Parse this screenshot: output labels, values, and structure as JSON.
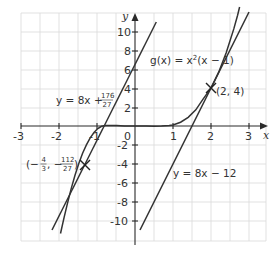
{
  "diagram": {
    "type": "function-graph",
    "axes": {
      "x_label": "x",
      "y_label": "y",
      "x_ticks": [
        "-3",
        "-2",
        "-1",
        "1",
        "2",
        "3"
      ],
      "y_ticks": [
        "10",
        "8",
        "6",
        "4",
        "2",
        "-2",
        "-4",
        "-6",
        "-8",
        "-10"
      ],
      "origin_label": "0",
      "x_range": [
        -3,
        3.3
      ],
      "y_range": [
        -12,
        12
      ]
    },
    "curves": [
      {
        "name": "g",
        "label": "g(x) = x²(x − 1)",
        "label_main": "g(x) = x",
        "label_sup": "2",
        "label_tail": "(x − 1)"
      },
      {
        "name": "tangent-upper",
        "label_prefix": "y = 8x +",
        "frac_num": "176",
        "frac_den": "27"
      },
      {
        "name": "tangent-lower",
        "label": "y = 8x − 12"
      }
    ],
    "points": [
      {
        "label": "(2, 4)",
        "x": 2,
        "y": 4
      },
      {
        "label_open": "(−",
        "x_num": "4",
        "x_den": "3",
        "sep": ", −",
        "y_num": "112",
        "y_den": "27",
        "label_close": ")",
        "x": -1.3333,
        "y": -4.1481
      }
    ],
    "colors": {
      "line": "#333333",
      "grid": "#d9d9d9",
      "text": "#333333"
    }
  }
}
